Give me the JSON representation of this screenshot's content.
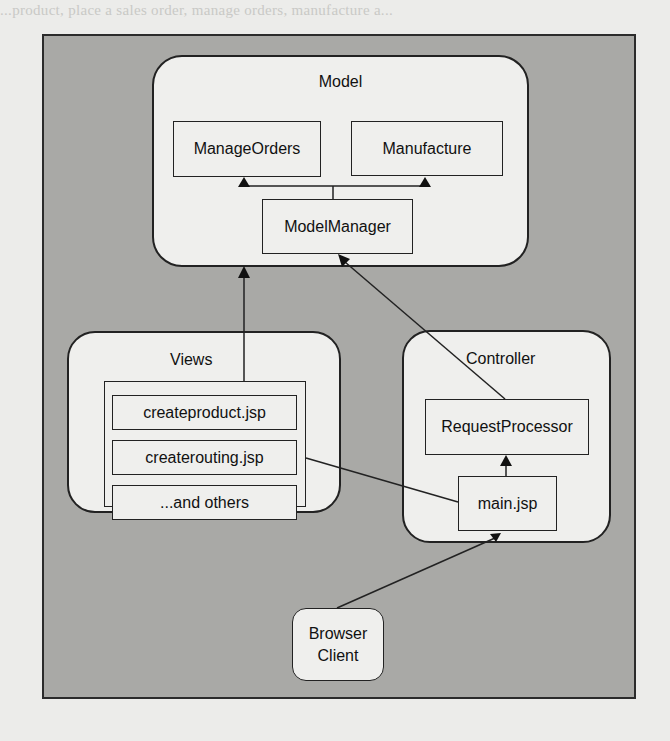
{
  "page_bleed_text": "...product, place a sales order, manage orders, manufacture a...",
  "diagram": {
    "model": {
      "title": "Model",
      "components": [
        {
          "label": "ManageOrders"
        },
        {
          "label": "Manufacture"
        },
        {
          "label": "ModelManager"
        }
      ]
    },
    "views": {
      "title": "Views",
      "pages": [
        {
          "label": "createproduct.jsp"
        },
        {
          "label": "createrouting.jsp"
        },
        {
          "label": "...and others"
        }
      ]
    },
    "controller": {
      "title": "Controller",
      "components": [
        {
          "label": "RequestProcessor"
        },
        {
          "label": "main.jsp"
        }
      ]
    },
    "client": {
      "label_line1": "Browser",
      "label_line2": "Client"
    },
    "connections": [
      {
        "from": "ModelManager",
        "to": "ManageOrders",
        "arrow": "filled-triangle"
      },
      {
        "from": "ModelManager",
        "to": "Manufacture",
        "arrow": "filled-triangle"
      },
      {
        "from": "Views",
        "to": "Model",
        "arrow": "filled-triangle"
      },
      {
        "from": "RequestProcessor",
        "to": "ModelManager",
        "arrow": "filled-triangle"
      },
      {
        "from": "main.jsp",
        "to": "RequestProcessor",
        "arrow": "filled-triangle"
      },
      {
        "from": "createrouting.jsp",
        "to": "main.jsp",
        "arrow": "none"
      },
      {
        "from": "Browser Client",
        "to": "main.jsp",
        "arrow": "filled-triangle"
      }
    ],
    "colors": {
      "frame_fill": "#a9a9a6",
      "box_fill": "#efefed",
      "stroke": "#222222",
      "page_bg": "#ececea"
    }
  }
}
